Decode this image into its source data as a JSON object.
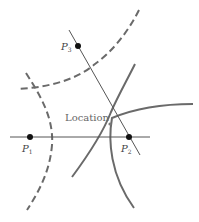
{
  "diagram": {
    "title": "",
    "colors": {
      "curve": "#6a6a6a",
      "line": "#555555",
      "point": "#111111",
      "label": "#444444"
    },
    "points": [
      {
        "id": "P1",
        "letter": "P",
        "subscript": "1",
        "x": 30,
        "y": 137
      },
      {
        "id": "P2",
        "letter": "P",
        "subscript": "2",
        "x": 129,
        "y": 137
      },
      {
        "id": "P3",
        "letter": "P",
        "subscript": "3",
        "x": 78,
        "y": 46
      }
    ],
    "location_label": "Location",
    "edges": [
      {
        "from": "P1",
        "to": "P2",
        "type": "baseline"
      },
      {
        "from": "P3",
        "to": "P2",
        "type": "baseline"
      }
    ],
    "curves": [
      {
        "name": "hyperbola-p1p3-upper",
        "style": "dashed"
      },
      {
        "name": "hyperbola-p1p3-left",
        "style": "dashed"
      },
      {
        "name": "hyperbola-p1p2-left",
        "style": "dashed"
      },
      {
        "name": "hyperbola-p2p3-upper",
        "style": "solid"
      },
      {
        "name": "hyperbola-p2p3-lower",
        "style": "solid"
      },
      {
        "name": "hyperbola-p1p2-right",
        "style": "solid"
      }
    ]
  }
}
